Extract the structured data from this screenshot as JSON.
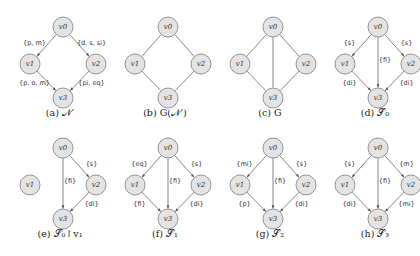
{
  "panels": [
    {
      "id": "a",
      "caption": "(a) 𝒩′",
      "directed": true,
      "isolated": [],
      "edges": [
        {
          "from": "v0",
          "to": "v1",
          "label": "{p, m}"
        },
        {
          "from": "v0",
          "to": "v2",
          "label": "{d, s, si}"
        },
        {
          "from": "v1",
          "to": "v3",
          "label": "{p, o, m}"
        },
        {
          "from": "v2",
          "to": "v3",
          "label": "{pi, eq}"
        }
      ]
    },
    {
      "id": "b",
      "caption": "(b) G(𝒩′)",
      "directed": false,
      "isolated": [],
      "edges": [
        {
          "from": "v0",
          "to": "v1",
          "label": ""
        },
        {
          "from": "v0",
          "to": "v2",
          "label": ""
        },
        {
          "from": "v1",
          "to": "v3",
          "label": ""
        },
        {
          "from": "v2",
          "to": "v3",
          "label": ""
        }
      ]
    },
    {
      "id": "c",
      "caption": "(c) G",
      "directed": false,
      "isolated": [],
      "edges": [
        {
          "from": "v0",
          "to": "v1",
          "label": ""
        },
        {
          "from": "v0",
          "to": "v2",
          "label": ""
        },
        {
          "from": "v0",
          "to": "v3",
          "label": ""
        },
        {
          "from": "v1",
          "to": "v3",
          "label": ""
        },
        {
          "from": "v2",
          "to": "v3",
          "label": ""
        }
      ]
    },
    {
      "id": "d",
      "caption": "(d) 𝒮₀",
      "directed": true,
      "isolated": [],
      "edges": [
        {
          "from": "v0",
          "to": "v1",
          "label": "{s}"
        },
        {
          "from": "v0",
          "to": "v2",
          "label": "{s}"
        },
        {
          "from": "v0",
          "to": "v3",
          "label": "{fi}"
        },
        {
          "from": "v1",
          "to": "v3",
          "label": "{di}"
        },
        {
          "from": "v2",
          "to": "v3",
          "label": "{di}"
        }
      ]
    },
    {
      "id": "e",
      "caption": "(e) 𝒮₀↾v₁",
      "directed": true,
      "isolated": [
        "v1"
      ],
      "edges": [
        {
          "from": "v0",
          "to": "v2",
          "label": "{s}"
        },
        {
          "from": "v0",
          "to": "v3",
          "label": "{fi}"
        },
        {
          "from": "v2",
          "to": "v3",
          "label": "{di}"
        }
      ]
    },
    {
      "id": "f",
      "caption": "(f) 𝒮₁",
      "directed": true,
      "isolated": [],
      "edges": [
        {
          "from": "v0",
          "to": "v1",
          "label": "{eq}"
        },
        {
          "from": "v0",
          "to": "v2",
          "label": "{s}"
        },
        {
          "from": "v0",
          "to": "v3",
          "label": "{fi}"
        },
        {
          "from": "v1",
          "to": "v3",
          "label": "{fi}"
        },
        {
          "from": "v2",
          "to": "v3",
          "label": "{di}"
        }
      ]
    },
    {
      "id": "g",
      "caption": "(g) 𝒮₂",
      "directed": true,
      "isolated": [],
      "edges": [
        {
          "from": "v0",
          "to": "v1",
          "label": "{mi}"
        },
        {
          "from": "v0",
          "to": "v2",
          "label": "{s}"
        },
        {
          "from": "v0",
          "to": "v3",
          "label": "{fi}"
        },
        {
          "from": "v1",
          "to": "v3",
          "label": "{p}"
        },
        {
          "from": "v2",
          "to": "v3",
          "label": "{di}"
        }
      ]
    },
    {
      "id": "h",
      "caption": "(h) 𝒮₃",
      "directed": true,
      "isolated": [],
      "edges": [
        {
          "from": "v0",
          "to": "v1",
          "label": "{s}"
        },
        {
          "from": "v0",
          "to": "v2",
          "label": "{m}"
        },
        {
          "from": "v0",
          "to": "v3",
          "label": "{fi}"
        },
        {
          "from": "v1",
          "to": "v3",
          "label": "{di}"
        },
        {
          "from": "v2",
          "to": "v3",
          "label": "{mi}"
        }
      ]
    }
  ],
  "node_labels": {
    "v0": "v0",
    "v1": "v1",
    "v2": "v2",
    "v3": "v3"
  },
  "colors": {
    "node_fill": "#e3e3e3",
    "node_stroke": "#8a8a8a",
    "edge": "#555555"
  }
}
